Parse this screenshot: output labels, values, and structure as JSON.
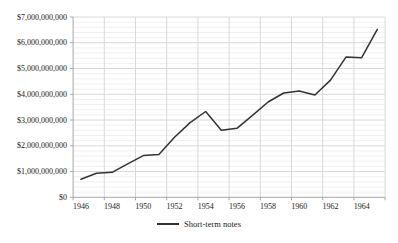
{
  "window": {
    "background": "#ffffff"
  },
  "colors": {
    "series_line": "#333333",
    "major_gridline": "#d9d9d9",
    "minor_gridline": "#f0f0f0",
    "axis_line": "#a6a6a6",
    "tick_mark": "#a6a6a6",
    "label_text": "#1a1a1a"
  },
  "chart_data": {
    "type": "line",
    "title": "",
    "xlabel": "",
    "ylabel": "",
    "legend_position": "bottom",
    "grid": "horizontal major+minor, vertical major",
    "ylim": [
      0,
      7000000000
    ],
    "y_major_unit": 1000000000,
    "y_minor_unit": 200000000,
    "y_tick_labels": [
      "$0",
      "$1,000,000,000",
      "$2,000,000,000",
      "$3,000,000,000",
      "$4,000,000,000",
      "$5,000,000,000",
      "$6,000,000,000",
      "$7,000,000,000"
    ],
    "x": [
      1946,
      1947,
      1948,
      1949,
      1950,
      1951,
      1952,
      1953,
      1954,
      1955,
      1956,
      1957,
      1958,
      1959,
      1960,
      1961,
      1962,
      1963,
      1964,
      1965
    ],
    "x_tick_labels": [
      "1946",
      "1948",
      "1950",
      "1952",
      "1954",
      "1956",
      "1958",
      "1960",
      "1962",
      "1964"
    ],
    "x_label_step": 2,
    "series": [
      {
        "name": "Short-term notes",
        "color": "#333333",
        "values": [
          700000000,
          930000000,
          970000000,
          1300000000,
          1620000000,
          1660000000,
          2330000000,
          2900000000,
          3330000000,
          2600000000,
          2680000000,
          3180000000,
          3700000000,
          4050000000,
          4130000000,
          3970000000,
          4550000000,
          5450000000,
          5420000000,
          6520000000
        ]
      }
    ]
  }
}
